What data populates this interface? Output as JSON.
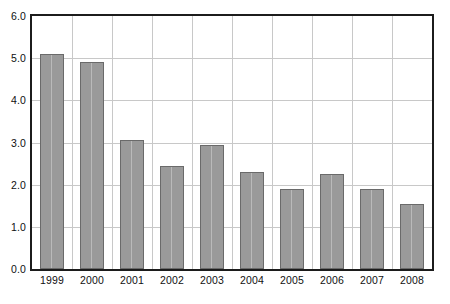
{
  "chart_data": {
    "type": "bar",
    "title": "",
    "subtitle": "",
    "xlabel": "",
    "ylabel": "",
    "categories": [
      "1999",
      "2000",
      "2001",
      "2002",
      "2003",
      "2004",
      "2005",
      "2006",
      "2007",
      "2008"
    ],
    "values": [
      5.1,
      4.9,
      3.05,
      2.45,
      2.95,
      2.3,
      1.9,
      2.25,
      1.9,
      1.55
    ],
    "ylim": [
      0.0,
      6.0
    ],
    "ytick_labels": [
      "6.0",
      "5.0",
      "4.0",
      "3.0",
      "2.0",
      "1.0",
      "0.0"
    ],
    "ytick_values": [
      6.0,
      5.0,
      4.0,
      3.0,
      2.0,
      1.0,
      0.0
    ],
    "grid": true,
    "grid_orientation": "both",
    "legend": false,
    "legend_position": "none",
    "annotations": []
  },
  "style": {
    "bar_fill": "#9a9a9a",
    "bar_border": "#6a6a6a",
    "grid_color": "#c8c8c8",
    "axis_color": "#1c1c1c",
    "text_color": "#101010",
    "background": "#ffffff"
  }
}
